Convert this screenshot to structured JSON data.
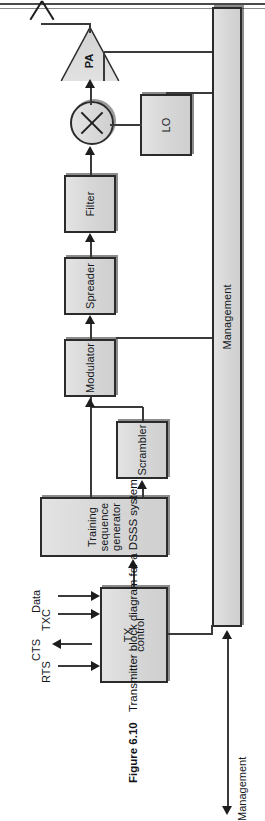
{
  "figure": {
    "number": "Figure 6.10",
    "caption": "Transmitter block diagram for a DSSS system."
  },
  "diagram": {
    "title": "Transmitter block diagram for a DSSS system",
    "blocks": [
      {
        "id": "tx-control",
        "label": "TX\ncontrol",
        "label_lines": [
          "TX",
          "control"
        ]
      },
      {
        "id": "training-sequence-generator",
        "label": "Training sequence generator",
        "label_lines": [
          "Training sequence",
          "generator"
        ]
      },
      {
        "id": "scrambler",
        "label": "Scrambler"
      },
      {
        "id": "modulator",
        "label": "Modulator"
      },
      {
        "id": "spreader",
        "label": "Spreader"
      },
      {
        "id": "filter",
        "label": "Filter"
      },
      {
        "id": "mixer",
        "label": "",
        "shape": "circle-multiplier"
      },
      {
        "id": "local-oscillator",
        "label": "LO"
      },
      {
        "id": "power-amplifier",
        "label": "PA",
        "shape": "triangle"
      },
      {
        "id": "management",
        "label": "Management"
      },
      {
        "id": "antenna",
        "label": "",
        "shape": "antenna"
      }
    ],
    "ports": [
      {
        "id": "rts",
        "label": "RTS",
        "direction": "in"
      },
      {
        "id": "cts",
        "label": "CTS",
        "direction": "out"
      },
      {
        "id": "txc",
        "label": "TXC",
        "direction": "in"
      },
      {
        "id": "data",
        "label": "Data",
        "direction": "in"
      },
      {
        "id": "management-port",
        "label": "Management",
        "direction": "bidirectional"
      }
    ],
    "colors": {
      "block_fill": "#d8d8d8",
      "block_stroke": "#2b2b2b",
      "line": "#3a3a3a",
      "text": "#15181c",
      "background": "#ffffff"
    }
  }
}
